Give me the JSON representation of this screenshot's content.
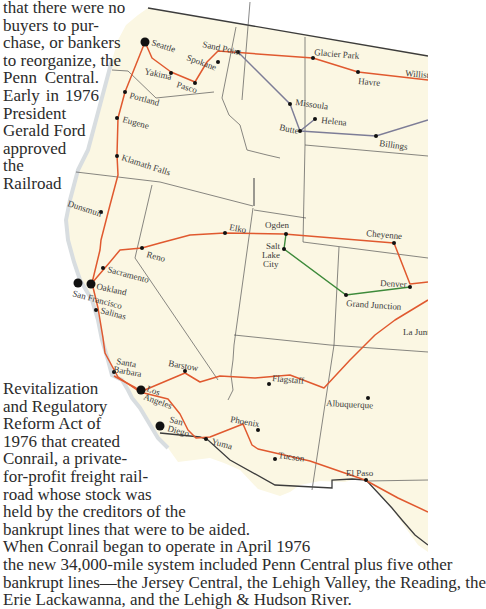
{
  "article": {
    "top_lines": [
      "that there were no",
      "buyers to pur-",
      "chase, or bankers",
      "to reorganize, the",
      "Penn Central.",
      "Early in 1976",
      "President",
      "Gerald Ford",
      "approved",
      "the",
      "Railroad"
    ],
    "bottom_lines": [
      "Revitalization",
      "and Regulatory",
      "Reform Act of",
      "1976 that created",
      "Conrail, a private-",
      "for-profit freight rail-",
      "road whose stock was",
      "held by the creditors of the",
      "bankrupt lines that were to be aided.",
      "When Conrail began to operate in April 1976",
      "the new 34,000-mile system included Penn Central plus five other",
      "bankrupt lines—the Jersey Central, the Lehigh Valley, the Reading, the",
      "Erie Lackawanna, and the Lehigh & Hudson River.",
      "... before ... the ... Penn Central ... the ..."
    ]
  },
  "map": {
    "colors": {
      "land": "#fbf7e3",
      "route_primary": "#e0592f",
      "route_secondary": "#7d7d97",
      "route_green": "#3d8a3a",
      "border": "#555555",
      "coast": "#3c3c3c"
    },
    "cities": {
      "seattle": "Seattle",
      "sand_point": "Sand Point",
      "spokane": "Spokane",
      "glacier_park": "Glacier Park",
      "havre": "Havre",
      "williston": "Willist",
      "yakima": "Yakima",
      "pasco": "Pasco",
      "missoula": "Missoula",
      "helena": "Helena",
      "butte": "Butte",
      "billings": "Billings",
      "portland": "Portland",
      "eugene": "Eugene",
      "klamath_falls": "Klamath Falls",
      "dunsmuir": "Dunsmuir",
      "elko": "Elko",
      "ogden": "Ogden",
      "salt_lake_city_1": "Salt",
      "salt_lake_city_2": "Lake",
      "salt_lake_city_3": "City",
      "cheyenne": "Cheyenne",
      "reno": "Reno",
      "sacramento": "Sacramento",
      "oakland": "Oakland",
      "san_francisco": "San Francisco",
      "salinas": "Salinas",
      "denver": "Denver",
      "grand_junction": "Grand Junction",
      "la_junta": "La Junt",
      "santa_barbara_1": "Santa",
      "santa_barbara_2": "Barbara",
      "barstow": "Barstow",
      "flagstaff": "Flagstaff",
      "albuquerque": "Albuquerque",
      "los_angeles_1": "Los",
      "los_angeles_2": "Angeles",
      "phoenix": "Phoenix",
      "san_diego_1": "San",
      "san_diego_2": "Diego",
      "yuma": "Yuma",
      "tucson": "Tucson",
      "el_paso": "El Paso"
    }
  }
}
